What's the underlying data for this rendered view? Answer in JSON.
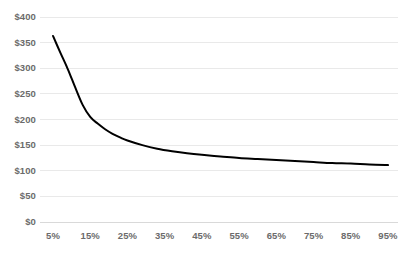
{
  "chart_data": {
    "type": "line",
    "title": "",
    "subtitle": "",
    "xlabel": "",
    "ylabel": "",
    "x": [
      5,
      15,
      25,
      35,
      45,
      55,
      65,
      75,
      85,
      95
    ],
    "x_tick_labels": [
      "5%",
      "15%",
      "25%",
      "35%",
      "45%",
      "55%",
      "65%",
      "75%",
      "85%",
      "95%"
    ],
    "y_tick_values": [
      0,
      50,
      100,
      150,
      200,
      250,
      300,
      350,
      400
    ],
    "y_tick_labels": [
      "$0",
      "$50",
      "$100",
      "$150",
      "$200",
      "$250",
      "$300",
      "$350",
      "$400"
    ],
    "xlim": [
      5,
      95
    ],
    "ylim": [
      0,
      400
    ],
    "grid": "horizontal",
    "legend": "none",
    "series": [
      {
        "name": "Cost per unit",
        "color": "#000000",
        "line_width": 2,
        "curve": "smooth",
        "markers": false,
        "points": [
          {
            "x": 5,
            "y": 363
          },
          {
            "x": 7,
            "y": 330
          },
          {
            "x": 9,
            "y": 298
          },
          {
            "x": 11,
            "y": 262
          },
          {
            "x": 13,
            "y": 228
          },
          {
            "x": 15,
            "y": 205
          },
          {
            "x": 17,
            "y": 192
          },
          {
            "x": 19,
            "y": 181
          },
          {
            "x": 21,
            "y": 172
          },
          {
            "x": 23,
            "y": 165
          },
          {
            "x": 25,
            "y": 159
          },
          {
            "x": 29,
            "y": 150
          },
          {
            "x": 33,
            "y": 143
          },
          {
            "x": 37,
            "y": 138
          },
          {
            "x": 41,
            "y": 134
          },
          {
            "x": 45,
            "y": 131
          },
          {
            "x": 50,
            "y": 128
          },
          {
            "x": 55,
            "y": 125
          },
          {
            "x": 60,
            "y": 123
          },
          {
            "x": 65,
            "y": 121
          },
          {
            "x": 70,
            "y": 119
          },
          {
            "x": 75,
            "y": 117
          },
          {
            "x": 80,
            "y": 115
          },
          {
            "x": 85,
            "y": 114
          },
          {
            "x": 90,
            "y": 112
          },
          {
            "x": 95,
            "y": 111
          }
        ]
      }
    ],
    "colors": {
      "line": "#000000",
      "gridline": "#e9e9e9",
      "axis_line": "#d9d9d9",
      "tick_text": "#6b6b6b",
      "background": "#ffffff"
    }
  }
}
